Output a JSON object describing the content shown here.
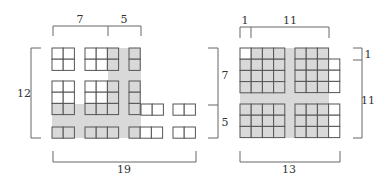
{
  "colors": {
    "shade": "#d9d9d9",
    "cell_fill": "#ffffff",
    "cell_stroke": "#555555",
    "bracket": "#666666",
    "text": "#333333"
  },
  "cell_size": 11.2,
  "diagrams": [
    {
      "name": "left-diagram",
      "shade_regions": [
        {
          "x": 108,
          "y": 48,
          "w": 33,
          "h": 90
        },
        {
          "x": 52,
          "y": 104,
          "w": 89,
          "h": 34
        }
      ],
      "blocks": [
        {
          "x": 52,
          "y": 48,
          "cols": 2,
          "rows": 2,
          "shaded": []
        },
        {
          "x": 85,
          "y": 48,
          "cols": 3,
          "rows": 2,
          "shaded": [
            [
              0,
              2
            ],
            [
              1,
              2
            ]
          ]
        },
        {
          "x": 129,
          "y": 48,
          "cols": 1,
          "rows": 2,
          "shaded": [
            [
              0,
              0
            ],
            [
              1,
              0
            ]
          ]
        },
        {
          "x": 52,
          "y": 81,
          "cols": 2,
          "rows": 3,
          "shaded": [
            [
              2,
              0
            ],
            [
              2,
              1
            ]
          ]
        },
        {
          "x": 85,
          "y": 81,
          "cols": 3,
          "rows": 3,
          "shaded": [
            [
              0,
              2
            ],
            [
              1,
              2
            ],
            [
              2,
              0
            ],
            [
              2,
              1
            ],
            [
              2,
              2
            ]
          ]
        },
        {
          "x": 129,
          "y": 81,
          "cols": 1,
          "rows": 3,
          "shaded": [
            [
              0,
              0
            ],
            [
              1,
              0
            ],
            [
              2,
              0
            ]
          ]
        },
        {
          "x": 141,
          "y": 104,
          "cols": 2,
          "rows": 1,
          "shaded": []
        },
        {
          "x": 173,
          "y": 104,
          "cols": 2,
          "rows": 1,
          "shaded": []
        },
        {
          "x": 52,
          "y": 127,
          "cols": 2,
          "rows": 1,
          "shaded": [
            [
              0,
              0
            ],
            [
              0,
              1
            ]
          ]
        },
        {
          "x": 85,
          "y": 127,
          "cols": 3,
          "rows": 1,
          "shaded": [
            [
              0,
              0
            ],
            [
              0,
              1
            ],
            [
              0,
              2
            ]
          ]
        },
        {
          "x": 129,
          "y": 127,
          "cols": 3,
          "rows": 1,
          "shaded": [
            [
              0,
              0
            ]
          ]
        },
        {
          "x": 173,
          "y": 127,
          "cols": 2,
          "rows": 1,
          "shaded": []
        }
      ],
      "brackets": [
        {
          "orient": "top",
          "x1": 53,
          "x2": 141,
          "y": 26,
          "len": 10,
          "ticks": [
            108
          ]
        },
        {
          "orient": "left",
          "y1": 48,
          "y2": 138,
          "x": 31,
          "len": 10,
          "ticks": []
        },
        {
          "orient": "right",
          "y1": 48,
          "y2": 138,
          "x": 218,
          "len": 10,
          "ticks": [
            105
          ]
        },
        {
          "orient": "bottom",
          "x1": 53,
          "x2": 196,
          "y": 162,
          "len": 11,
          "ticks": []
        }
      ],
      "labels": [
        {
          "text": "7",
          "x": 80,
          "y": 23
        },
        {
          "text": "5",
          "x": 124,
          "y": 23
        },
        {
          "text": "12",
          "x": 24,
          "y": 97
        },
        {
          "text": "7",
          "x": 225,
          "y": 79
        },
        {
          "text": "5",
          "x": 225,
          "y": 126
        },
        {
          "text": "19",
          "x": 124,
          "y": 173
        }
      ]
    },
    {
      "name": "right-diagram",
      "shade_regions": [
        {
          "x": 240,
          "y": 48,
          "w": 89,
          "h": 90
        }
      ],
      "blocks": [
        {
          "x": 240,
          "y": 48,
          "cols": 4,
          "rows": 4,
          "shaded": [
            [
              0,
              1
            ],
            [
              0,
              2
            ],
            [
              0,
              3
            ],
            [
              1,
              0
            ],
            [
              1,
              1
            ],
            [
              1,
              2
            ],
            [
              1,
              3
            ],
            [
              2,
              0
            ],
            [
              2,
              1
            ],
            [
              2,
              2
            ],
            [
              2,
              3
            ],
            [
              3,
              0
            ],
            [
              3,
              1
            ],
            [
              3,
              2
            ],
            [
              3,
              3
            ]
          ]
        },
        {
          "x": 295,
          "y": 48,
          "cols": 3,
          "rows": 1,
          "shaded": [
            [
              0,
              0
            ],
            [
              0,
              1
            ],
            [
              0,
              2
            ]
          ]
        },
        {
          "x": 295,
          "y": 59,
          "cols": 4,
          "rows": 3,
          "shaded": [
            [
              0,
              0
            ],
            [
              0,
              1
            ],
            [
              0,
              2
            ],
            [
              1,
              0
            ],
            [
              1,
              1
            ],
            [
              1,
              2
            ],
            [
              2,
              0
            ],
            [
              2,
              1
            ],
            [
              2,
              2
            ]
          ]
        },
        {
          "x": 240,
          "y": 104,
          "cols": 4,
          "rows": 3,
          "shaded": [
            [
              0,
              0
            ],
            [
              0,
              1
            ],
            [
              0,
              2
            ],
            [
              0,
              3
            ],
            [
              1,
              0
            ],
            [
              1,
              1
            ],
            [
              1,
              2
            ],
            [
              1,
              3
            ],
            [
              2,
              0
            ],
            [
              2,
              1
            ],
            [
              2,
              2
            ],
            [
              2,
              3
            ]
          ]
        },
        {
          "x": 295,
          "y": 104,
          "cols": 4,
          "rows": 3,
          "shaded": [
            [
              0,
              0
            ],
            [
              0,
              1
            ],
            [
              0,
              2
            ],
            [
              1,
              0
            ],
            [
              1,
              1
            ],
            [
              1,
              2
            ],
            [
              2,
              0
            ],
            [
              2,
              1
            ],
            [
              2,
              2
            ]
          ]
        }
      ],
      "brackets": [
        {
          "orient": "top",
          "x1": 240,
          "x2": 329,
          "y": 27,
          "len": 11,
          "ticks": [
            251
          ]
        },
        {
          "orient": "right",
          "y1": 48,
          "y2": 138,
          "x": 362,
          "len": 9,
          "ticks": [
            60
          ]
        },
        {
          "orient": "bottom",
          "x1": 240,
          "x2": 340,
          "y": 162,
          "len": 11,
          "ticks": []
        }
      ],
      "labels": [
        {
          "text": "1",
          "x": 245,
          "y": 24
        },
        {
          "text": "11",
          "x": 290,
          "y": 24
        },
        {
          "text": "1",
          "x": 368,
          "y": 58
        },
        {
          "text": "11",
          "x": 368,
          "y": 104
        },
        {
          "text": "13",
          "x": 289,
          "y": 173
        }
      ]
    }
  ]
}
